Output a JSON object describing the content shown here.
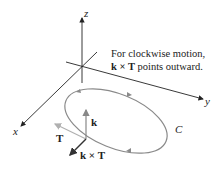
{
  "diagram": {
    "axes": {
      "x": "x",
      "y": "y",
      "z": "z"
    },
    "curve_label": "C",
    "vectors": {
      "k": "k",
      "T": "T",
      "kxT": "k × T"
    },
    "note": {
      "line1": "For clockwise motion,",
      "line2_bold": "k × T",
      "line2_rest": " points outward."
    },
    "colors": {
      "axes": "#222222",
      "curve": "#8a8a8a",
      "T_vector": "#b0b0b0",
      "k_vector": "#888888",
      "kxT_vector": "#333333"
    }
  }
}
